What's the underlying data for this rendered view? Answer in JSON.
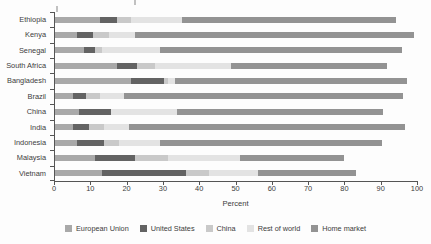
{
  "chart_data": {
    "type": "bar",
    "orientation": "horizontal",
    "stacked": true,
    "categories": [
      "Ethiopia",
      "Kenya",
      "Senegal",
      "South Africa",
      "Bangladesh",
      "Brazil",
      "China",
      "India",
      "Indonesia",
      "Malaysia",
      "Vietnam"
    ],
    "series": [
      {
        "name": "European Union",
        "color": "#a9a9a9",
        "values": [
          12.5,
          6,
          8,
          17,
          21,
          5,
          6.5,
          5,
          6,
          11,
          13
        ]
      },
      {
        "name": "United States",
        "color": "#636363",
        "values": [
          4.5,
          4.5,
          3,
          5.5,
          9,
          3.5,
          9,
          4.5,
          7.5,
          11,
          23
        ]
      },
      {
        "name": "China",
        "color": "#c9c9c9",
        "values": [
          4,
          4.5,
          2,
          5,
          1,
          4,
          0,
          4,
          4,
          9,
          6.5
        ]
      },
      {
        "name": "Rest of world",
        "color": "#e3e3e3",
        "values": [
          14,
          7,
          16,
          21,
          2,
          6.5,
          18,
          7,
          11.5,
          20,
          13.5
        ]
      },
      {
        "name": "Home market",
        "color": "#939393",
        "values": [
          59,
          77,
          66.5,
          43,
          64,
          77,
          57,
          76,
          61,
          28.5,
          27
        ]
      }
    ],
    "xlabel": "Percent",
    "x_ticks": [
      0,
      10,
      20,
      30,
      40,
      50,
      60,
      70,
      80,
      90,
      100
    ],
    "xlim": [
      0,
      100
    ],
    "grid": false,
    "legend_position": "bottom"
  }
}
